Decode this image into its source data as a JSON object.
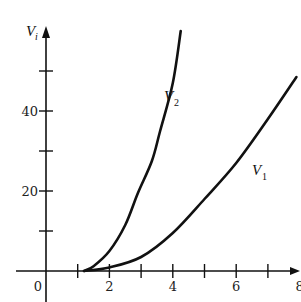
{
  "chart_data": {
    "type": "line",
    "title": "",
    "xlabel": "",
    "ylabel": "V_i",
    "ylabel_main": "V",
    "ylabel_sub": "i",
    "xlim": [
      -0.2,
      8
    ],
    "ylim": [
      -3,
      61
    ],
    "grid": false,
    "legend": "inline labels on curves",
    "x_ticks": [
      1,
      2,
      3,
      4,
      5,
      6,
      7
    ],
    "x_tick_labels": [
      {
        "value": 0,
        "text": "0"
      },
      {
        "value": 2,
        "text": "2"
      },
      {
        "value": 4,
        "text": "4"
      },
      {
        "value": 6,
        "text": "6"
      },
      {
        "value": 8,
        "text": "8"
      }
    ],
    "y_ticks": [
      10,
      20,
      30,
      40,
      50
    ],
    "y_tick_labels": [
      {
        "value": 20,
        "text": "20"
      },
      {
        "value": 40,
        "text": "40"
      }
    ],
    "series": [
      {
        "name": "V_2",
        "label_main": "V",
        "label_sub": "2",
        "x": [
          1.2,
          1.5,
          2.0,
          2.5,
          2.9,
          3.34,
          3.6,
          4.0,
          4.25
        ],
        "values": [
          0,
          1.2,
          5.0,
          11.5,
          19.5,
          27.5,
          35.0,
          47.0,
          60.0
        ]
      },
      {
        "name": "V_1",
        "label_main": "V",
        "label_sub": "1",
        "x": [
          1.2,
          2.0,
          3.0,
          4.0,
          5.0,
          6.0,
          7.0,
          7.9
        ],
        "values": [
          0,
          0.9,
          3.5,
          9.5,
          18.0,
          27.0,
          38.0,
          48.5
        ]
      }
    ]
  }
}
